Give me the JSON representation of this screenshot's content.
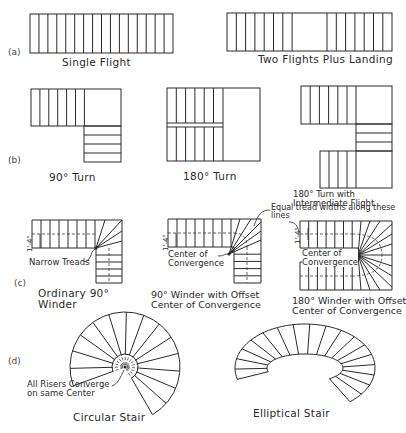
{
  "figure": {
    "rows": [
      {
        "label": "(a)",
        "captions": [
          "Single Flight",
          "Two Flights Plus Landing"
        ]
      },
      {
        "label": "(b)",
        "captions": [
          "90° Turn",
          "180° Turn",
          "180° Turn with\nIntermediate Flight"
        ]
      },
      {
        "label": "(c)",
        "captions": [
          "Ordinary 90°\nWinder",
          "90° Winder with Offset\nCenter of Convergence",
          "180° Winder with Offset\nCenter of Convergence"
        ]
      },
      {
        "label": "(d)",
        "captions": [
          "Circular Stair",
          "Elliptical Stair"
        ]
      }
    ],
    "annotations": {
      "narrow_treads": "Narrow Treads",
      "center_conv_1": "Center of\nConvergence",
      "center_conv_2": "Center of\nConvergence",
      "equal_tread": "Equal tread widths along these\nlines",
      "all_risers": "All Risers Converge\non same Center",
      "dim_1": "1'-4\"",
      "dim_2": "1'-4\"",
      "dim_3": "1'-4\""
    }
  }
}
